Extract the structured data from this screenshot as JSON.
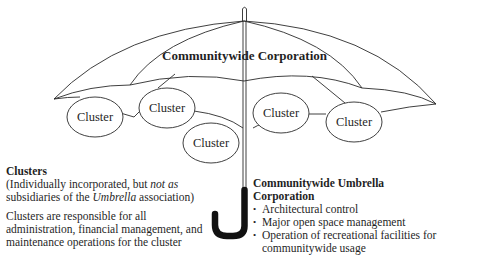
{
  "umbrella": {
    "canopy_label": "Communitywide Corporation",
    "clusters": [
      {
        "label": "Cluster",
        "cx": 95,
        "cy": 117
      },
      {
        "label": "Cluster",
        "cx": 167,
        "cy": 108
      },
      {
        "label": "Cluster",
        "cx": 211,
        "cy": 143
      },
      {
        "label": "Cluster",
        "cx": 281,
        "cy": 113
      },
      {
        "label": "Cluster",
        "cx": 354,
        "cy": 122
      }
    ]
  },
  "left_panel": {
    "heading": "Clusters",
    "note_part1": "(Individually incorporated, but ",
    "note_italic1": "not as",
    "note_part2": "subsidiaries of the ",
    "note_italic2": "Umbrella",
    "note_part3": " association)",
    "description": "Clusters are responsible for all administration, financial management, and maintenance operations for the cluster"
  },
  "right_panel": {
    "heading_line1": "Communitywide Umbrella",
    "heading_line2": "Corporation",
    "items": [
      "Architectural control",
      "Major open space management",
      "Operation of recreational facilities for communitywide usage"
    ]
  },
  "colors": {
    "line": "#2a2a2a",
    "handle": "#111111",
    "background": "#ffffff"
  }
}
